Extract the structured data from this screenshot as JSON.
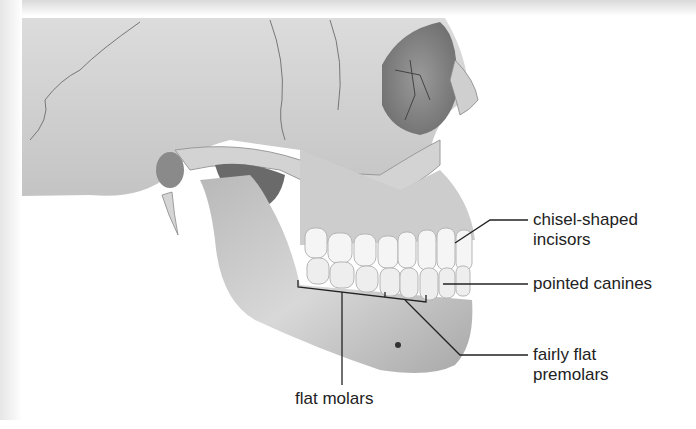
{
  "figure": {
    "labels": [
      {
        "id": "incisors",
        "text": [
          "chisel-shaped",
          "incisors"
        ]
      },
      {
        "id": "canines",
        "text": [
          "pointed canines"
        ]
      },
      {
        "id": "premolars",
        "text": [
          "fairly flat",
          "premolars"
        ]
      },
      {
        "id": "molars",
        "text": [
          "flat molars"
        ]
      }
    ],
    "colors": {
      "bone_light": "#e6e6e6",
      "bone_mid": "#bdbdbd",
      "bone_dark": "#7a7a7a",
      "tooth": "#f4f4f4",
      "line": "#222222"
    }
  }
}
